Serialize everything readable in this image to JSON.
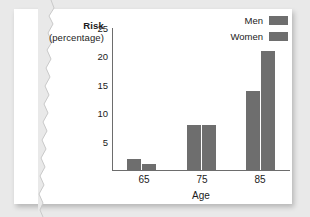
{
  "chart_data": {
    "type": "bar",
    "title": "",
    "categories": [
      "65",
      "75",
      "85"
    ],
    "series": [
      {
        "name": "Men",
        "values": [
          2,
          8,
          14
        ],
        "color": "#6e6e6e"
      },
      {
        "name": "Women",
        "values": [
          1,
          8,
          21
        ],
        "color": "#6e6e6e"
      }
    ],
    "xlabel": "Age",
    "ylabel_line1": "Risk",
    "ylabel_line2": "(percentage)",
    "yticks": [
      25,
      20,
      15,
      10,
      5
    ],
    "ylim": [
      0,
      25
    ],
    "grid": false,
    "legend_position": "top-right"
  },
  "legend": {
    "items": [
      {
        "label": "Men",
        "color": "#6e6e6e"
      },
      {
        "label": "Women",
        "color": "#6e6e6e"
      }
    ]
  },
  "colors": {
    "bar": "#6e6e6e",
    "axis": "#6d6d6d",
    "text": "#1b1b1b",
    "card": "#ffffff",
    "background": "#e9e9e9"
  }
}
